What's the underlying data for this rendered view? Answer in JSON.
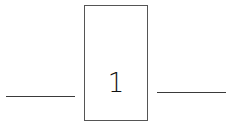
{
  "box": {
    "value": "1"
  },
  "colors": {
    "line": "#3a3a3a",
    "box_border": "#555555",
    "text": "#111111",
    "background": "#ffffff"
  }
}
